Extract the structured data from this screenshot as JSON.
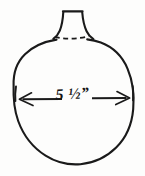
{
  "drawing": {
    "kind": "hand-drawn-dimension-sketch",
    "subject": "round vessel with flared neck",
    "background_color": "#fdfdfc",
    "ink_color": "#1a1a1a",
    "dimension": {
      "label": "5 ½”",
      "value": "5 1/2",
      "unit": "inch",
      "unit_symbol": "”",
      "measures": "diameter",
      "arrow_style": "double-headed horizontal arrow with end ticks"
    },
    "parts": [
      {
        "name": "body",
        "shape": "circle",
        "style": "solid"
      },
      {
        "name": "neck",
        "shape": "flared-trapezoid",
        "style": "solid"
      },
      {
        "name": "neck-base",
        "shape": "arc",
        "style": "dashed"
      }
    ]
  }
}
